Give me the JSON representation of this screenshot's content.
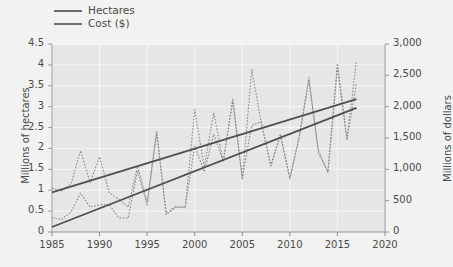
{
  "legend": {
    "position": "top-left",
    "items": [
      {
        "label": "Hectares",
        "color": "#6b6b6b",
        "style": "solid"
      },
      {
        "label": "Cost ($)",
        "color": "#6f6f6f",
        "style": "solid"
      }
    ]
  },
  "axes": {
    "left": {
      "title": "Millions of hectares",
      "min": 0,
      "max": 4.5,
      "step": 0.5,
      "ticks": [
        "0",
        "0.5",
        "1",
        "1.5",
        "2",
        "2.5",
        "3",
        "3.5",
        "4",
        "4.5"
      ]
    },
    "right": {
      "title": "Millions of dollars",
      "min": 0,
      "max": 3000,
      "step": 500,
      "ticks": [
        "0",
        "500",
        "1,000",
        "1,500",
        "2,000",
        "2,500",
        "3,000"
      ]
    },
    "bottom": {
      "title": "",
      "min": 1985,
      "max": 2020,
      "step": 5,
      "ticks": [
        "1985",
        "1990",
        "1995",
        "2000",
        "2005",
        "2010",
        "2015",
        "2020"
      ]
    }
  },
  "colors": {
    "plot_background": "#e6e6e6",
    "grid": "#f7f7f7",
    "axis_line": "#9a9a9a",
    "data_series": "#8a8a8a",
    "trend_line": "#4f4f4f",
    "page_background": "#f2f2f2",
    "text": "#4a4a4a"
  },
  "chart_data": {
    "type": "line",
    "title": "",
    "xlabel": "",
    "ylabel": "Millions of hectares",
    "y2label": "Millions of dollars",
    "xlim": [
      1985,
      2020
    ],
    "ylim": [
      0,
      4.5
    ],
    "y2lim": [
      0,
      3000
    ],
    "grid": true,
    "legend_position": "top-left",
    "x": [
      1985,
      1986,
      1987,
      1988,
      1989,
      1990,
      1991,
      1992,
      1993,
      1994,
      1995,
      1996,
      1997,
      1998,
      1999,
      2000,
      2001,
      2002,
      2003,
      2004,
      2005,
      2006,
      2007,
      2008,
      2009,
      2010,
      2011,
      2012,
      2013,
      2014,
      2015,
      2016,
      2017
    ],
    "series": [
      {
        "name": "Hectares",
        "axis": "left",
        "units": "millions of hectares",
        "style": "dotted",
        "values": [
          1.05,
          0.98,
          1.15,
          1.95,
          1.18,
          1.8,
          0.95,
          0.78,
          0.6,
          1.58,
          0.72,
          2.42,
          0.45,
          0.62,
          0.58,
          2.93,
          1.55,
          2.86,
          1.68,
          3.2,
          1.27,
          3.89,
          2.6,
          1.58,
          2.35,
          1.27,
          2.3,
          3.7,
          1.9,
          1.44,
          4.03,
          2.23,
          4.1
        ]
      },
      {
        "name": "Cost ($)",
        "axis": "right",
        "units": "millions of dollars",
        "style": "dotted",
        "values": [
          230,
          200,
          320,
          620,
          400,
          430,
          440,
          230,
          220,
          980,
          430,
          1580,
          280,
          390,
          400,
          1370,
          960,
          1560,
          1130,
          2090,
          860,
          1700,
          1760,
          1060,
          1540,
          860,
          1520,
          2420,
          1300,
          950,
          2620,
          1470,
          2380
        ]
      }
    ],
    "trendlines": [
      {
        "name": "Hectares trend",
        "axis": "left",
        "style": "solid",
        "x": [
          1985,
          2017
        ],
        "values": [
          0.95,
          3.18
        ]
      },
      {
        "name": "Cost ($) trend",
        "axis": "right",
        "style": "solid",
        "x": [
          1985,
          2017
        ],
        "values": [
          80,
          1980
        ]
      }
    ]
  }
}
